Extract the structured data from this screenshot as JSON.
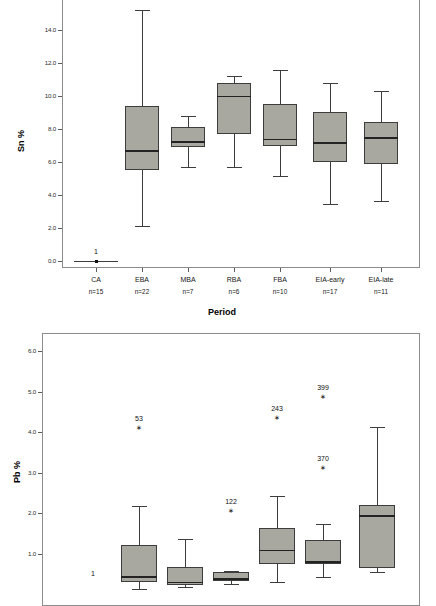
{
  "figure": {
    "background": "#ffffff",
    "box_fill": "#a8a8a0",
    "line_color": "#3d3d3d"
  },
  "chart_data": [
    {
      "type": "box",
      "title": "",
      "ylabel": "Sn %",
      "xlabel": "Period",
      "ylim": [
        0.0,
        15.6
      ],
      "yticks": [
        "0.0",
        "2.0",
        "4.0",
        "6.0",
        "8.0",
        "10.0",
        "12.0",
        "14.0"
      ],
      "ytick_values": [
        0.0,
        2.0,
        4.0,
        6.0,
        8.0,
        10.0,
        12.0,
        14.0
      ],
      "grid": false,
      "legend": "none",
      "categories": [
        "CA",
        "EBA",
        "MBA",
        "RBA",
        "FBA",
        "EIA-early",
        "EIA-late"
      ],
      "counts": [
        "n=15",
        "n=22",
        "n=7",
        "n=6",
        "n=10",
        "n=17",
        "n=11"
      ],
      "boxes": [
        {
          "category": "CA",
          "has_box": false,
          "flat_value": 0.0
        },
        {
          "category": "EBA",
          "has_box": true,
          "whisker_low": 2.1,
          "q1": 5.5,
          "median": 6.7,
          "q3": 9.4,
          "whisker_high": 15.2
        },
        {
          "category": "MBA",
          "has_box": true,
          "whisker_low": 5.7,
          "q1": 6.9,
          "median": 7.25,
          "q3": 8.1,
          "whisker_high": 8.8
        },
        {
          "category": "RBA",
          "has_box": true,
          "whisker_low": 5.7,
          "q1": 7.7,
          "median": 10.0,
          "q3": 10.8,
          "whisker_high": 11.2
        },
        {
          "category": "FBA",
          "has_box": true,
          "whisker_low": 5.15,
          "q1": 6.95,
          "median": 7.4,
          "q3": 9.5,
          "whisker_high": 11.55
        },
        {
          "category": "EIA-early",
          "has_box": true,
          "whisker_low": 3.45,
          "q1": 6.0,
          "median": 7.2,
          "q3": 9.05,
          "whisker_high": 10.8
        },
        {
          "category": "EIA-late",
          "has_box": true,
          "whisker_low": 3.65,
          "q1": 5.85,
          "median": 7.5,
          "q3": 8.4,
          "whisker_high": 10.3
        }
      ],
      "outliers": [
        {
          "category": "CA",
          "label": "1",
          "value": 0.0,
          "marker": "star"
        }
      ]
    },
    {
      "type": "box",
      "title": "",
      "ylabel": "Pb %",
      "xlabel": "",
      "ylim": [
        0.2,
        6.35
      ],
      "yticks": [
        "1.0",
        "2.0",
        "3.0",
        "4.0",
        "5.0",
        "6.0"
      ],
      "ytick_values": [
        1.0,
        2.0,
        3.0,
        4.0,
        5.0,
        6.0
      ],
      "grid": false,
      "legend": "none",
      "categories": [
        "CA",
        "EBA",
        "MBA",
        "RBA",
        "FBA",
        "EIA-early",
        "EIA-late"
      ],
      "counts": [],
      "boxes": [
        {
          "category": "CA",
          "has_box": false
        },
        {
          "category": "EBA",
          "has_box": true,
          "whisker_low": 0.12,
          "q1": 0.3,
          "median": 0.44,
          "q3": 1.2,
          "whisker_high": 2.17
        },
        {
          "category": "MBA",
          "has_box": true,
          "whisker_low": 0.18,
          "q1": 0.22,
          "median": 0.3,
          "q3": 0.67,
          "whisker_high": 1.37
        },
        {
          "category": "RBA",
          "has_box": true,
          "whisker_low": 0.24,
          "q1": 0.31,
          "median": 0.39,
          "q3": 0.54,
          "whisker_high": 0.56
        },
        {
          "category": "FBA",
          "has_box": true,
          "whisker_low": 0.3,
          "q1": 0.74,
          "median": 1.09,
          "q3": 1.62,
          "whisker_high": 2.41
        },
        {
          "category": "EIA-early",
          "has_box": true,
          "whisker_low": 0.42,
          "q1": 0.75,
          "median": 0.81,
          "q3": 1.34,
          "whisker_high": 1.72
        },
        {
          "category": "EIA-late",
          "has_box": true,
          "whisker_low": 0.55,
          "q1": 0.65,
          "median": 1.94,
          "q3": 2.2,
          "whisker_high": 4.12
        }
      ],
      "outliers": [
        {
          "category": "CA",
          "label": "1",
          "value": 0.28,
          "marker": "star"
        },
        {
          "category": "EBA",
          "label": "53",
          "value": 4.09,
          "marker": "star"
        },
        {
          "category": "RBA",
          "label": "122",
          "value": 2.05,
          "marker": "star"
        },
        {
          "category": "FBA",
          "label": "243",
          "value": 4.35,
          "marker": "star"
        },
        {
          "category": "EIA-early",
          "label": "399",
          "value": 4.87,
          "marker": "star"
        },
        {
          "category": "EIA-early",
          "label": "370",
          "value": 3.11,
          "marker": "star"
        }
      ]
    }
  ],
  "top_chart": {
    "ylabel": "Sn %",
    "xlabel": "Period",
    "ytick_labels": [
      "14.0",
      "12.0",
      "10.0",
      "8.0",
      "6.0",
      "4.0",
      "2.0",
      "0.0"
    ],
    "xtick_labels": [
      "CA",
      "EBA",
      "MBA",
      "RBA",
      "FBA",
      "EIA-early",
      "EIA-late"
    ],
    "xtick_counts": [
      "n=15",
      "n=22",
      "n=7",
      "n=6",
      "n=10",
      "n=17",
      "n=11"
    ],
    "outlier_label": "1"
  },
  "bottom_chart": {
    "ylabel": "Pb %",
    "ytick_labels": [
      "6.0",
      "5.0",
      "4.0",
      "3.0",
      "2.0",
      "1.0"
    ],
    "outlier_labels": [
      "53",
      "122",
      "243",
      "399",
      "370",
      "1"
    ]
  }
}
